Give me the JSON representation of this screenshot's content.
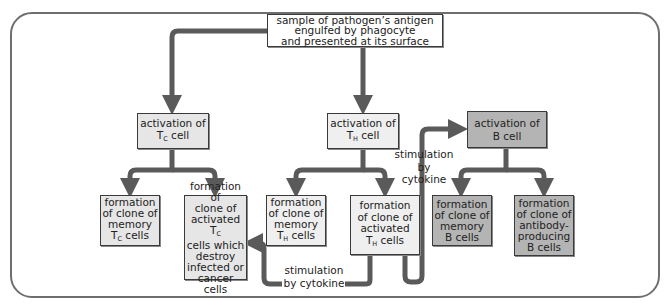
{
  "diagram": {
    "type": "flowchart",
    "title": "",
    "colors": {
      "arrow": "#5a5a5a",
      "frame": "#6e6e6e",
      "box_border": "#3a3a3a",
      "box_white": "#ffffff",
      "box_tc": "#e6e6e6",
      "box_th": "#efefef",
      "box_b": "#b4b4b4"
    },
    "nodes": {
      "antigen": {
        "line1": "sample of pathogen’s antigen",
        "line2": "engulfed by phagocyte",
        "line3": "and presented at its surface"
      },
      "tc_activation": {
        "text": "activation of",
        "cell": "T",
        "sub": "C",
        "suffix": " cell"
      },
      "th_activation": {
        "text": "activation of",
        "cell": "T",
        "sub": "H",
        "suffix": " cell"
      },
      "b_activation": {
        "line1": "activation of",
        "line2": "B cell"
      },
      "tc_memory": {
        "line1": "formation",
        "line2": "of clone of",
        "line3": "memory",
        "cell": "T",
        "sub": "C",
        "suffix": " cells"
      },
      "tc_activated": {
        "line1": "formation of",
        "line2": "clone of",
        "line3a": "activated T",
        "sub": "C",
        "line4": "cells which",
        "line5": "destroy",
        "line6": "infected or",
        "line7": "cancer cells"
      },
      "th_memory": {
        "line1": "formation",
        "line2": "of clone of",
        "line3": "memory",
        "cell": "T",
        "sub": "H",
        "suffix": " cells"
      },
      "th_activated": {
        "line1": "formation",
        "line2": "of clone of",
        "line3": "activated",
        "cell": "T",
        "sub": "H",
        "suffix": " cells"
      },
      "b_memory": {
        "line1": "formation",
        "line2": "of clone of",
        "line3": "memory",
        "line4": "B cells"
      },
      "b_antibody": {
        "line1": "formation",
        "line2": "of clone of",
        "line3": "antibody-",
        "line4": "producing",
        "line5": "B cells"
      }
    },
    "labels": {
      "stim_upper": {
        "line1": "stimulation",
        "line2": "by cytokine"
      },
      "stim_lower": {
        "line1": "stimulation",
        "line2": "by cytokine"
      }
    },
    "edges": [
      {
        "from": "antigen",
        "to": "tc_activation"
      },
      {
        "from": "antigen",
        "to": "th_activation"
      },
      {
        "from": "tc_activation",
        "to": "tc_memory"
      },
      {
        "from": "tc_activation",
        "to": "tc_activated"
      },
      {
        "from": "th_activation",
        "to": "th_memory"
      },
      {
        "from": "th_activation",
        "to": "th_activated"
      },
      {
        "from": "th_activated",
        "to": "b_activation",
        "label": "stimulation by cytokine"
      },
      {
        "from": "th_activated",
        "to": "tc_activated",
        "label": "stimulation by cytokine"
      },
      {
        "from": "b_activation",
        "to": "b_memory"
      },
      {
        "from": "b_activation",
        "to": "b_antibody"
      }
    ]
  }
}
